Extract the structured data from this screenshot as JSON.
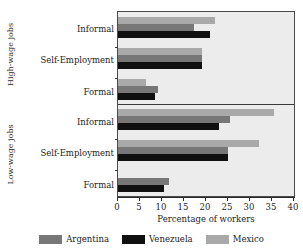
{
  "chart_data": {
    "type": "bar",
    "orientation": "horizontal",
    "title": "",
    "xlabel": "Percentage of workers",
    "ylabel": "",
    "xlim": [
      0,
      40
    ],
    "xticks": [
      0,
      5,
      10,
      15,
      20,
      25,
      30,
      35,
      40
    ],
    "grid": false,
    "legend_position": "bottom",
    "legend": [
      "Argentina",
      "Venezuela",
      "Mexico"
    ],
    "series_colors": {
      "Argentina": "#777777",
      "Venezuela": "#101010",
      "Mexico": "#a9a9a9"
    },
    "panels": [
      {
        "name": "High-wage jobs",
        "categories": [
          "Informal",
          "Self-Employment",
          "Formal"
        ],
        "series": [
          {
            "name": "Argentina",
            "values": [
              17.3,
              19.0,
              9.0
            ]
          },
          {
            "name": "Venezuela",
            "values": [
              21.0,
              19.0,
              8.5
            ]
          },
          {
            "name": "Mexico",
            "values": [
              22.0,
              19.0,
              6.3
            ]
          }
        ]
      },
      {
        "name": "Low-wage jobs",
        "categories": [
          "Informal",
          "Self-Employment",
          "Formal"
        ],
        "series": [
          {
            "name": "Argentina",
            "values": [
              25.4,
              25.0,
              11.5
            ]
          },
          {
            "name": "Venezuela",
            "values": [
              23.0,
              25.0,
              10.5
            ]
          },
          {
            "name": "Mexico",
            "values": [
              35.5,
              32.0,
              0.0
            ]
          }
        ]
      }
    ]
  },
  "axis": {
    "x_title": "Percentage of workers",
    "tick_labels": [
      "0",
      "5",
      "10",
      "15",
      "20",
      "25",
      "30",
      "35",
      "40"
    ]
  },
  "panel_labels": {
    "high": "High-wage jobs",
    "low": "Low-wage jobs"
  },
  "categories": {
    "informal": "Informal",
    "self_employment": "Self-Employment",
    "formal": "Formal"
  },
  "legend": {
    "argentina": "Argentina",
    "venezuela": "Venezuela",
    "mexico": "Mexico"
  }
}
